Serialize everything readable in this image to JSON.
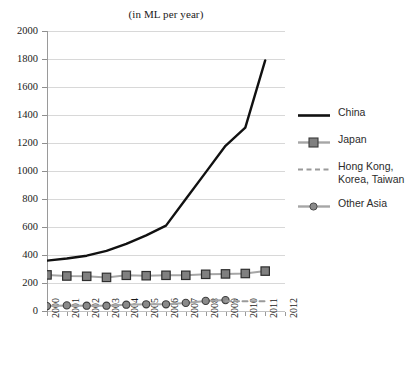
{
  "chart_data": {
    "type": "line",
    "title": "(in ML per year)",
    "xlabel": "",
    "ylabel": "",
    "ylim": [
      0,
      2000
    ],
    "ytick_step": 200,
    "grid": "horizontal",
    "legend_position": "right",
    "x": [
      2000,
      2001,
      2002,
      2003,
      2004,
      2005,
      2006,
      2007,
      2008,
      2009,
      2010,
      2011,
      2012
    ],
    "categories": [
      "2000",
      "2001",
      "2002",
      "2003",
      "2004",
      "2005",
      "2006",
      "2007",
      "2008",
      "2009",
      "2010",
      "2011",
      "2012"
    ],
    "yticks": [
      "0",
      "200",
      "400",
      "600",
      "800",
      "1000",
      "1200",
      "1400",
      "1600",
      "1800",
      "2000"
    ],
    "series": [
      {
        "name": "China",
        "color": "#111111",
        "style": "solid",
        "marker": "none",
        "x": [
          2000,
          2001,
          2002,
          2003,
          2004,
          2005,
          2006,
          2007,
          2008,
          2009,
          2010,
          2011
        ],
        "values": [
          360,
          375,
          395,
          430,
          480,
          540,
          610,
          800,
          990,
          1180,
          1310,
          1790
        ]
      },
      {
        "name": "Japan",
        "color": "#a6a6a6",
        "marker_color": "#808080",
        "style": "solid",
        "marker": "square",
        "x": [
          2000,
          2001,
          2002,
          2003,
          2004,
          2005,
          2006,
          2007,
          2008,
          2009,
          2010,
          2011
        ],
        "values": [
          258,
          250,
          248,
          240,
          255,
          252,
          255,
          255,
          262,
          265,
          268,
          285
        ]
      },
      {
        "name": "Hong Kong, Korea, Taiwan",
        "color": "#9a9a9a",
        "style": "dashed",
        "marker": "none",
        "x": [
          2009,
          2010,
          2011
        ],
        "values": [
          70,
          70,
          70
        ]
      },
      {
        "name": "Other Asia",
        "color": "#a6a6a6",
        "marker_color": "#8a8a8a",
        "style": "solid",
        "marker": "circle",
        "x": [
          2000,
          2001,
          2002,
          2003,
          2004,
          2005,
          2006,
          2007,
          2008,
          2009
        ],
        "values": [
          35,
          40,
          38,
          38,
          45,
          48,
          48,
          58,
          72,
          78
        ]
      }
    ]
  },
  "legend": {
    "entries": [
      {
        "label": "China",
        "line1": "China",
        "line2": ""
      },
      {
        "label": "Japan",
        "line1": "Japan",
        "line2": ""
      },
      {
        "label": "Hong Kong, Korea, Taiwan",
        "line1": "Hong Kong,",
        "line2": "Korea, Taiwan"
      },
      {
        "label": "Other Asia",
        "line1": "Other Asia",
        "line2": ""
      }
    ]
  },
  "colors": {
    "china": "#111111",
    "japan_line": "#a6a6a6",
    "japan_marker": "#808080",
    "hk_dash": "#9a9a9a",
    "other_asia_line": "#a6a6a6",
    "other_asia_marker": "#8a8a8a",
    "gridline": "#d8d8d8",
    "axis": "#9a9a9a",
    "text": "#1a1a1a",
    "background": "#ffffff"
  }
}
